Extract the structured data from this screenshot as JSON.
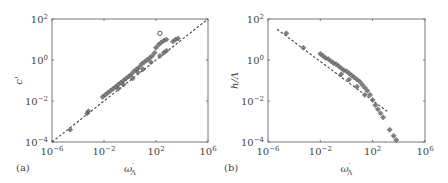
{
  "chart_data": [
    {
      "panel": "a",
      "type": "scatter",
      "panel_label": "(a)",
      "title": "",
      "xlabel": "ω'_Λ",
      "ylabel": "c'",
      "xscale": "log",
      "yscale": "log",
      "xlim": [
        1e-06,
        1000000.0
      ],
      "ylim": [
        0.0001,
        100.0
      ],
      "xticks": [
        "10^-6",
        "10^-2",
        "10^2",
        "10^6"
      ],
      "yticks": [
        "10^-4",
        "10^-2",
        "10^0",
        "10^2"
      ],
      "grid": false,
      "reference_line": {
        "style": "dashed",
        "log_x": [
          -6,
          6
        ],
        "log_y": [
          -4,
          2
        ]
      },
      "series": [
        {
          "name": "data (gray markers)",
          "log_points": [
            [
              -4.6,
              -3.4
            ],
            [
              -3.3,
              -2.6
            ],
            [
              -3.2,
              -2.5
            ],
            [
              -2.1,
              -1.8
            ],
            [
              -1.9,
              -1.7
            ],
            [
              -1.7,
              -1.6
            ],
            [
              -1.5,
              -1.5
            ],
            [
              -1.3,
              -1.4
            ],
            [
              -1.1,
              -1.3
            ],
            [
              -0.9,
              -1.2
            ],
            [
              -0.7,
              -1.1
            ],
            [
              -0.5,
              -1.0
            ],
            [
              -0.3,
              -0.9
            ],
            [
              -0.1,
              -0.8
            ],
            [
              0.1,
              -0.7
            ],
            [
              0.3,
              -0.55
            ],
            [
              0.5,
              -0.45
            ],
            [
              0.7,
              -0.35
            ],
            [
              0.9,
              -0.2
            ],
            [
              1.1,
              -0.1
            ],
            [
              1.3,
              0.0
            ],
            [
              1.5,
              0.1
            ],
            [
              1.7,
              0.2
            ],
            [
              1.9,
              0.35
            ],
            [
              -0.9,
              -1.4
            ],
            [
              -0.5,
              -1.2
            ],
            [
              0.2,
              -0.9
            ],
            [
              0.6,
              -0.6
            ],
            [
              1.0,
              -0.45
            ],
            [
              1.6,
              -0.1
            ],
            [
              2.0,
              0.6
            ],
            [
              2.2,
              0.75
            ],
            [
              2.4,
              0.85
            ],
            [
              2.6,
              0.95
            ],
            [
              2.8,
              1.0
            ],
            [
              2.3,
              0.2
            ],
            [
              2.6,
              0.35
            ],
            [
              2.8,
              0.45
            ],
            [
              3.3,
              0.9
            ],
            [
              3.5,
              1.0
            ],
            [
              3.7,
              1.05
            ]
          ]
        },
        {
          "name": "open circle",
          "log_points": [
            [
              2.3,
              1.3
            ]
          ]
        }
      ]
    },
    {
      "panel": "b",
      "type": "scatter",
      "panel_label": "(b)",
      "title": "",
      "xlabel": "ω'_Λ",
      "ylabel": "h/Λ",
      "xscale": "log",
      "yscale": "log",
      "xlim": [
        1e-06,
        1000000.0
      ],
      "ylim": [
        0.0001,
        100.0
      ],
      "xticks": [
        "10^-6",
        "10^-2",
        "10^2",
        "10^6"
      ],
      "yticks": [
        "10^-4",
        "10^-2",
        "10^0",
        "10^2"
      ],
      "grid": false,
      "reference_line": {
        "style": "dashed",
        "log_x": [
          -5.3,
          3.1
        ],
        "log_y": [
          1.5,
          -2.5
        ]
      },
      "series": [
        {
          "name": "data (gray markers)",
          "log_points": [
            [
              -4.6,
              1.3
            ],
            [
              -3.3,
              0.6
            ],
            [
              -2.0,
              0.3
            ],
            [
              -1.8,
              0.2
            ],
            [
              -1.6,
              0.1
            ],
            [
              -1.4,
              0.05
            ],
            [
              -1.2,
              -0.05
            ],
            [
              -1.0,
              -0.15
            ],
            [
              -0.8,
              -0.2
            ],
            [
              -0.6,
              -0.3
            ],
            [
              -0.4,
              -0.4
            ],
            [
              -0.2,
              -0.5
            ],
            [
              0.0,
              -0.55
            ],
            [
              0.2,
              -0.65
            ],
            [
              0.4,
              -0.75
            ],
            [
              0.6,
              -0.85
            ],
            [
              0.8,
              -0.95
            ],
            [
              1.0,
              -1.05
            ],
            [
              1.2,
              -1.2
            ],
            [
              1.4,
              -1.35
            ],
            [
              1.6,
              -1.5
            ],
            [
              1.8,
              -1.7
            ],
            [
              2.0,
              -1.95
            ],
            [
              2.2,
              -2.2
            ],
            [
              2.4,
              -2.4
            ],
            [
              2.6,
              -2.6
            ],
            [
              2.8,
              -2.8
            ],
            [
              -0.4,
              -0.7
            ],
            [
              0.2,
              -0.95
            ],
            [
              0.8,
              -1.3
            ],
            [
              1.4,
              -1.7
            ],
            [
              3.3,
              -3.4
            ],
            [
              3.6,
              -3.7
            ],
            [
              3.8,
              -3.9
            ]
          ]
        }
      ]
    }
  ],
  "panels": {
    "a": {
      "label": "(a)",
      "ylabel": "c'",
      "xlabel": "ω",
      "xlabel_sub": "Λ",
      "xlabel_sup": "′",
      "yticks": [
        {
          "base": "10",
          "exp": "2"
        },
        {
          "base": "10",
          "exp": "0"
        },
        {
          "base": "10",
          "exp": "−2"
        },
        {
          "base": "10",
          "exp": "−4"
        }
      ],
      "xticks": [
        {
          "base": "10",
          "exp": "−6"
        },
        {
          "base": "10",
          "exp": "−2"
        },
        {
          "base": "10",
          "exp": "2"
        },
        {
          "base": "10",
          "exp": "6"
        }
      ]
    },
    "b": {
      "label": "(b)",
      "ylabel": "h/Λ",
      "xlabel": "ω",
      "xlabel_sub": "Λ",
      "xlabel_sup": "′",
      "yticks": [
        {
          "base": "10",
          "exp": "2"
        },
        {
          "base": "10",
          "exp": "0"
        },
        {
          "base": "10",
          "exp": "−2"
        },
        {
          "base": "10",
          "exp": "−4"
        }
      ],
      "xticks": [
        {
          "base": "10",
          "exp": "−6"
        },
        {
          "base": "10",
          "exp": "−2"
        },
        {
          "base": "10",
          "exp": "2"
        },
        {
          "base": "10",
          "exp": "6"
        }
      ]
    }
  },
  "colors": {
    "axis": "#777777",
    "marker": "#6a6a6a",
    "marker_edge": "#4a4a4a",
    "dash": "#444444"
  }
}
